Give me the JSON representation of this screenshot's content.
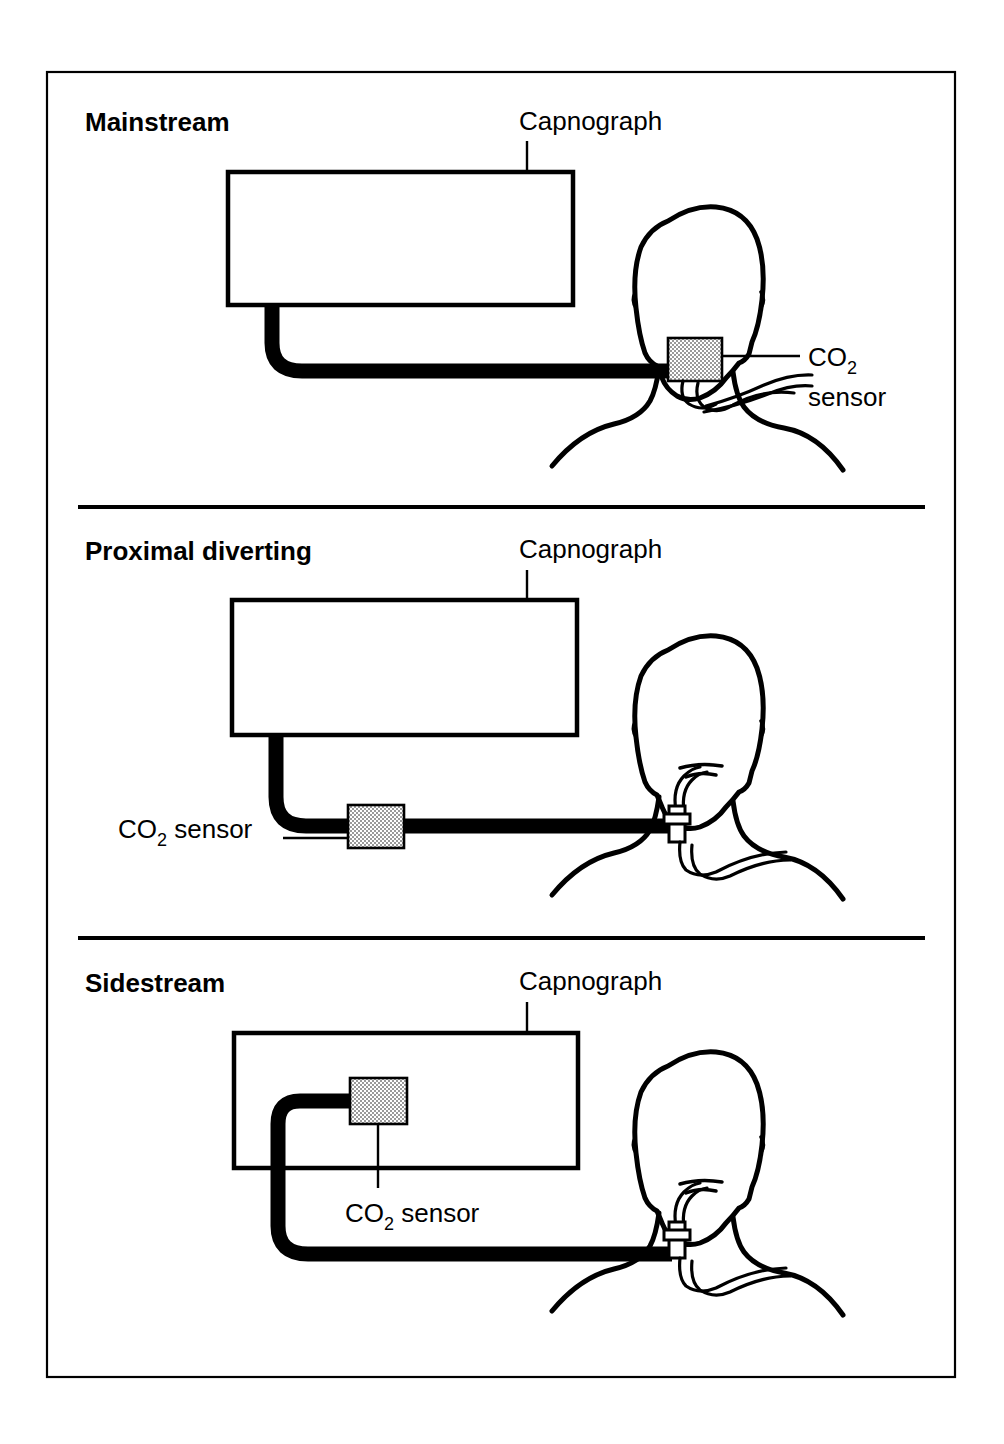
{
  "figure": {
    "colors": {
      "ink": "#000000",
      "paper": "#ffffff",
      "sensor_fill": "#c9c9c9"
    },
    "frame": {
      "x": 47,
      "y": 72,
      "width": 908,
      "height": 1305
    }
  },
  "panels": [
    {
      "id": "mainstream",
      "title": "Mainstream",
      "capnograph_label": "Capnograph",
      "sensor_label_line1": "CO",
      "sensor_label_sub": "2",
      "sensor_label_line2": "sensor",
      "sensor_label_full": "CO2 sensor",
      "sensor_position": "at-airway-adapter-on-patient",
      "monitor_box": {
        "x": 228,
        "y": 172,
        "width": 345,
        "height": 133
      },
      "sensor_box": {
        "x": 668,
        "y": 338,
        "width": 54,
        "height": 43
      }
    },
    {
      "id": "proximal-diverting",
      "title": "Proximal diverting",
      "capnograph_label": "Capnograph",
      "sensor_label_line1": "CO",
      "sensor_label_sub": "2",
      "sensor_label_line2": " sensor",
      "sensor_label_full": "CO2 sensor",
      "sensor_position": "in-sample-line-near-capnograph",
      "monitor_box": {
        "x": 232,
        "y": 600,
        "width": 345,
        "height": 135
      },
      "sensor_box": {
        "x": 348,
        "y": 805,
        "width": 56,
        "height": 43
      }
    },
    {
      "id": "sidestream",
      "title": "Sidestream",
      "capnograph_label": "Capnograph",
      "sensor_label_line1": "CO",
      "sensor_label_sub": "2",
      "sensor_label_line2": " sensor",
      "sensor_label_full": "CO2 sensor",
      "sensor_position": "inside-capnograph-housing",
      "monitor_box": {
        "x": 234,
        "y": 1033,
        "width": 344,
        "height": 135
      },
      "sensor_box": {
        "x": 350,
        "y": 1078,
        "width": 57,
        "height": 46
      }
    }
  ],
  "dividers": [
    {
      "y": 507,
      "x1": 78,
      "x2": 925
    },
    {
      "y": 938,
      "x1": 78,
      "x2": 925
    }
  ]
}
